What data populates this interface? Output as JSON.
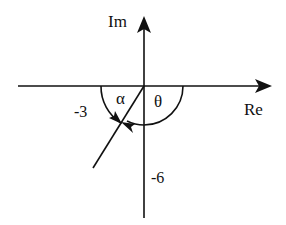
{
  "diagram": {
    "type": "complex-plane",
    "axes": {
      "real_label": "Re",
      "imag_label": "Im"
    },
    "points": {
      "real_tick": "-3",
      "imag_tick": "-6"
    },
    "angles": {
      "alpha": "α",
      "theta": "θ"
    },
    "colors": {
      "stroke": "#111111",
      "background": "#ffffff"
    }
  }
}
